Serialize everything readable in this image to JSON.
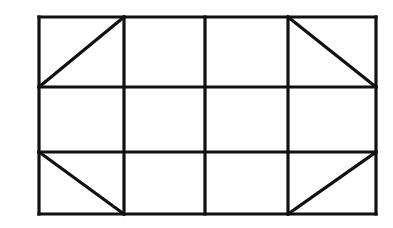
{
  "diagram": {
    "type": "grid-with-diagonals",
    "stroke_color": "#111111",
    "background": "#ffffff",
    "rows": 3,
    "cols": 4,
    "bounds": {
      "x1": 39,
      "y1": 17,
      "x2": 376,
      "y2": 214
    },
    "col_lines_x": [
      39,
      124,
      205,
      288,
      376
    ],
    "row_lines_y": [
      17,
      87,
      152,
      214
    ],
    "diagonals": [
      {
        "cell": "top-left",
        "from": [
          39,
          87
        ],
        "to": [
          124,
          17
        ]
      },
      {
        "cell": "top-right",
        "from": [
          288,
          17
        ],
        "to": [
          376,
          87
        ]
      },
      {
        "cell": "bottom-left",
        "from": [
          39,
          152
        ],
        "to": [
          124,
          214
        ]
      },
      {
        "cell": "bottom-right",
        "from": [
          288,
          214
        ],
        "to": [
          376,
          152
        ]
      }
    ]
  }
}
